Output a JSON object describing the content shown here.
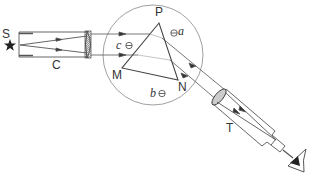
{
  "diagram": {
    "labels": {
      "source": "S",
      "collimator": "C",
      "apex": "P",
      "vertex_left": "M",
      "vertex_right": "N",
      "telescope": "T",
      "screw_a": "a",
      "screw_b": "b",
      "screw_c": "c"
    },
    "components": [
      {
        "id": "source",
        "icon": "star-icon"
      },
      {
        "id": "collimator",
        "icon": "collimator-tube"
      },
      {
        "id": "prism-table",
        "icon": "circle-table"
      },
      {
        "id": "prism",
        "icon": "triangle-prism"
      },
      {
        "id": "telescope",
        "icon": "telescope-tube"
      },
      {
        "id": "eye",
        "icon": "eye-icon"
      }
    ],
    "colors": {
      "stroke": "#555555",
      "text": "#333333",
      "background": "#ffffff"
    }
  }
}
